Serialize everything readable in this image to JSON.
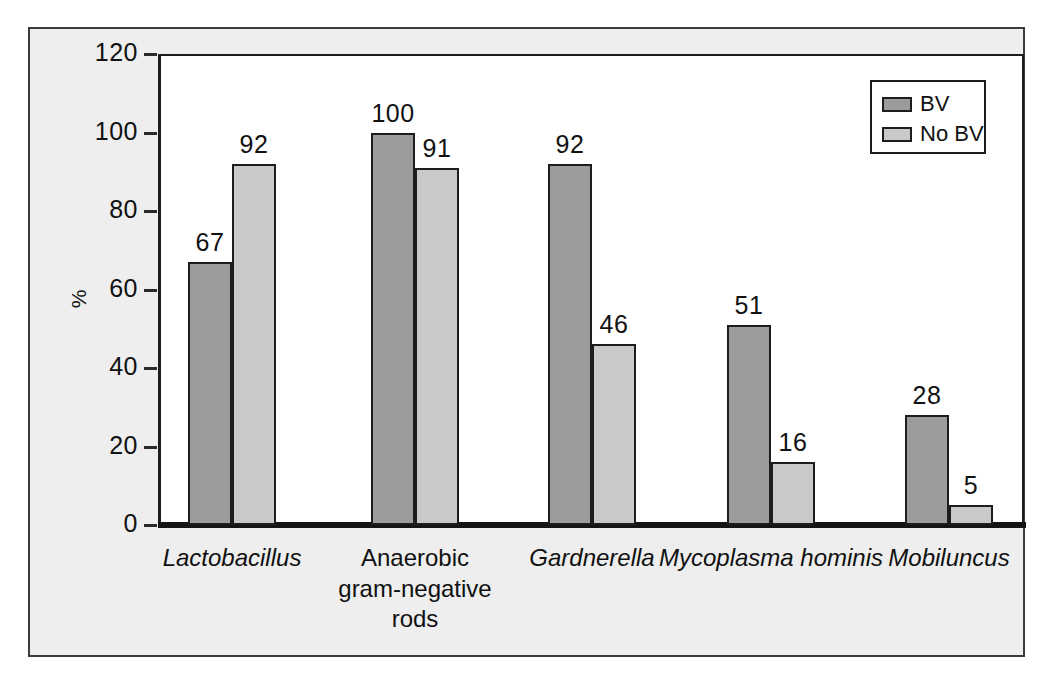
{
  "chart_data": {
    "type": "bar",
    "title": "",
    "xlabel": "",
    "ylabel": "%",
    "ylim": [
      0,
      120
    ],
    "yticks": [
      0,
      20,
      40,
      60,
      80,
      100,
      120
    ],
    "ytick_labels": [
      "0",
      "20",
      "40",
      "60",
      "80",
      "100",
      "120"
    ],
    "grid": false,
    "legend_position": "top-right",
    "categories": [
      "Lactobacillus",
      "Anaerobic\ngram-negative\nrods",
      "Gardnerella",
      "Mycoplasma hominis",
      "Mobiluncus"
    ],
    "category_styles": [
      "italic",
      "normal",
      "italic",
      "italic",
      "italic"
    ],
    "series": [
      {
        "name": "BV",
        "color": "#9c9c9c",
        "values": [
          67,
          100,
          92,
          51,
          28
        ],
        "value_labels": [
          "67",
          "100",
          "92",
          "51",
          "28"
        ]
      },
      {
        "name": "No BV",
        "color": "#c9c9c9",
        "values": [
          92,
          91,
          46,
          16,
          5
        ],
        "value_labels": [
          "92",
          "91",
          "46",
          "16",
          "5"
        ]
      }
    ]
  },
  "legend": {
    "entries": [
      {
        "label": "BV",
        "swatch": "bv"
      },
      {
        "label": "No BV",
        "swatch": "nobv"
      }
    ]
  },
  "colors": {
    "bv": "#9c9c9c",
    "nobv": "#c9c9c9",
    "panel": "#eeeeee",
    "plot": "#ffffff",
    "axis": "#1d1d1d"
  }
}
